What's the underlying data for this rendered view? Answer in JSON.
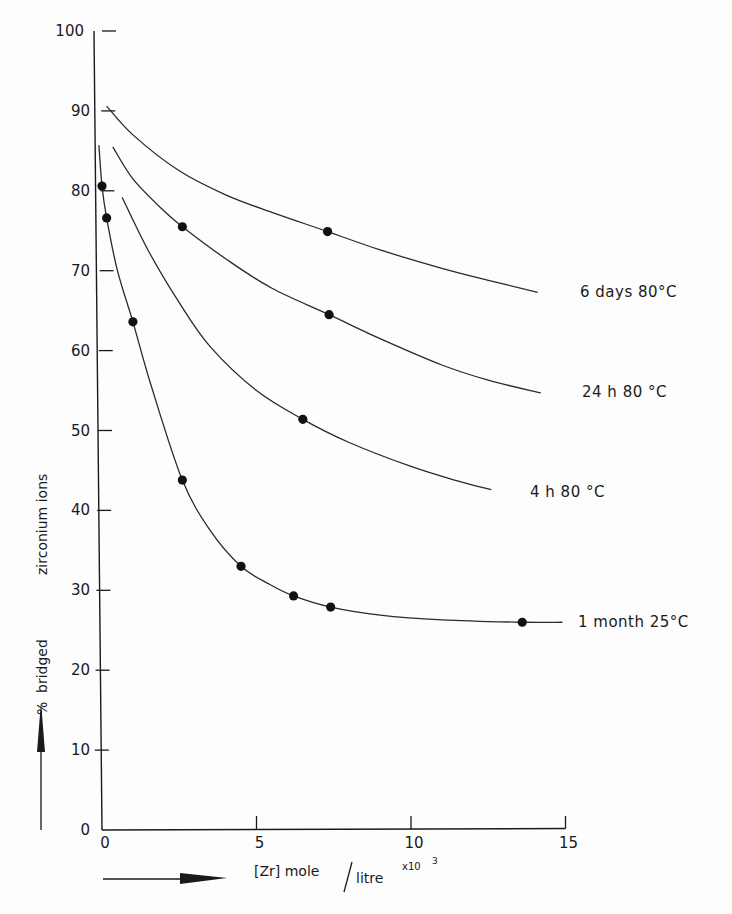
{
  "chart_data": {
    "type": "line",
    "title": "",
    "xlabel": "[Zr] mole/litre x10^3",
    "xlabel_parts": {
      "main": "[Zr] mole",
      "slash": "/",
      "denominator": "litre",
      "multiplier": "x10",
      "exponent": "3"
    },
    "ylabel": "% bridged zirconium ions",
    "ylabel_parts": [
      "%",
      "bridged",
      "zirconium ions"
    ],
    "xlim": [
      0,
      15
    ],
    "ylim": [
      0,
      100
    ],
    "x_ticks": [
      0,
      5,
      10,
      15
    ],
    "y_ticks": [
      0,
      10,
      20,
      30,
      40,
      50,
      60,
      70,
      80,
      90,
      100
    ],
    "grid": false,
    "legend": "inline labels at curve ends",
    "series": [
      {
        "name": "6 days 80°C",
        "label": "6 days  80°C",
        "curve": [
          [
            0.15,
            90.6
          ],
          [
            1,
            87
          ],
          [
            2.5,
            82.5
          ],
          [
            4,
            79.5
          ],
          [
            5.5,
            77.3
          ],
          [
            7.3,
            74.9
          ],
          [
            9,
            72.6
          ],
          [
            11,
            70.3
          ],
          [
            12.5,
            68.8
          ],
          [
            14.1,
            67.3
          ]
        ],
        "points": [
          [
            7.3,
            74.9
          ]
        ]
      },
      {
        "name": "24 h 80°C",
        "label": "24 h 80 °C",
        "curve": [
          [
            0.35,
            85.5
          ],
          [
            1,
            81.5
          ],
          [
            2,
            77.5
          ],
          [
            2.6,
            75.5
          ],
          [
            4,
            71.5
          ],
          [
            5.5,
            67.8
          ],
          [
            7.35,
            64.5
          ],
          [
            9,
            61.5
          ],
          [
            11,
            58.2
          ],
          [
            12.5,
            56.3
          ],
          [
            14.2,
            54.7
          ]
        ],
        "points": [
          [
            2.6,
            75.5
          ],
          [
            7.35,
            64.5
          ]
        ]
      },
      {
        "name": "4 h 80°C",
        "label": "4 h  80 °C",
        "curve": [
          [
            0.65,
            79.2
          ],
          [
            1.5,
            72.5
          ],
          [
            2.5,
            66
          ],
          [
            3.5,
            60.5
          ],
          [
            5,
            55
          ],
          [
            6.5,
            51.4
          ],
          [
            8,
            48.5
          ],
          [
            10,
            45.5
          ],
          [
            11.5,
            43.7
          ],
          [
            12.6,
            42.6
          ]
        ],
        "points": [
          [
            6.5,
            51.4
          ]
        ]
      },
      {
        "name": "1 month 25°C",
        "label": "1 month 25°C",
        "curve": [
          [
            -0.1,
            85.7
          ],
          [
            0,
            80.6
          ],
          [
            0.15,
            76.6
          ],
          [
            0.5,
            70
          ],
          [
            1.0,
            63.6
          ],
          [
            1.6,
            55.5
          ],
          [
            2.6,
            43.8
          ],
          [
            3.5,
            37.5
          ],
          [
            4.5,
            33.0
          ],
          [
            5.4,
            30.8
          ],
          [
            6.2,
            29.3
          ],
          [
            7.4,
            27.9
          ],
          [
            9,
            26.9
          ],
          [
            11,
            26.3
          ],
          [
            13.6,
            26.0
          ],
          [
            14.9,
            26.0
          ]
        ],
        "points": [
          [
            0,
            80.6
          ],
          [
            0.15,
            76.6
          ],
          [
            1.0,
            63.6
          ],
          [
            2.6,
            43.8
          ],
          [
            4.5,
            33.0
          ],
          [
            6.2,
            29.3
          ],
          [
            7.4,
            27.9
          ],
          [
            13.6,
            26.0
          ]
        ]
      }
    ]
  }
}
